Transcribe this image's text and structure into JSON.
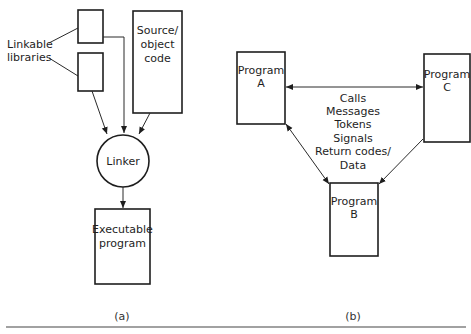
{
  "diagram_a": {
    "caption": "(a)",
    "side_label": [
      "Linkable",
      "libraries"
    ],
    "source_box": [
      "Source/",
      "object",
      "code"
    ],
    "linker": "Linker",
    "output_box": [
      "Executable",
      "program"
    ]
  },
  "diagram_b": {
    "caption": "(b)",
    "program_a": [
      "Program",
      "A"
    ],
    "program_b": [
      "Program",
      "B"
    ],
    "program_c": [
      "Program",
      "C"
    ],
    "interaction_labels": [
      "Calls",
      "Messages",
      "Tokens",
      "Signals",
      "Return codes/",
      "Data"
    ]
  },
  "colors": {
    "line": "#1e1e1e",
    "background": "#ffffff"
  }
}
